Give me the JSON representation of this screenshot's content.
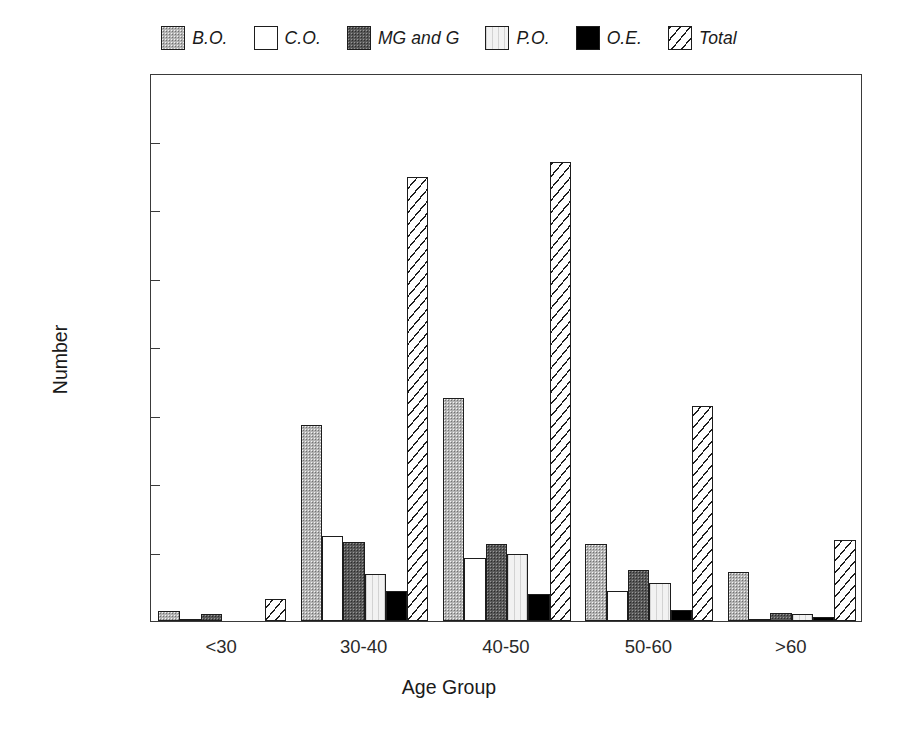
{
  "chart_data": {
    "type": "bar",
    "title": "",
    "subtitle": "",
    "xlabel": "Age Group",
    "ylabel": "Number",
    "categories": [
      "<30",
      "30-40",
      "40-50",
      "50-60",
      ">60"
    ],
    "ylim": [
      0,
      400
    ],
    "yticks": [
      0,
      50,
      100,
      150,
      200,
      250,
      300,
      350,
      400
    ],
    "grid": false,
    "legend_position": "top-center",
    "series": [
      {
        "name": "B.O.",
        "pattern": "gray-stipple",
        "values": [
          7,
          143,
          163,
          56,
          36
        ]
      },
      {
        "name": "C.O.",
        "pattern": "white-outline",
        "values": [
          1,
          62,
          46,
          22,
          1
        ]
      },
      {
        "name": "MG and G",
        "pattern": "dark-gray-stipple",
        "values": [
          5,
          58,
          56,
          37,
          6
        ]
      },
      {
        "name": "P.O.",
        "pattern": "light-vertical",
        "values": [
          0,
          34,
          49,
          28,
          5
        ]
      },
      {
        "name": "O.E.",
        "pattern": "solid-black",
        "values": [
          0,
          22,
          20,
          8,
          3
        ]
      },
      {
        "name": "Total",
        "pattern": "diagonal-hatch",
        "values": [
          16,
          324,
          335,
          157,
          59
        ]
      }
    ]
  },
  "legend": {
    "items": [
      {
        "label": "B.O."
      },
      {
        "label": "C.O."
      },
      {
        "label": "MG and G"
      },
      {
        "label": "P.O."
      },
      {
        "label": "O.E."
      },
      {
        "label": "Total"
      }
    ]
  },
  "axes": {
    "y_tick_labels": [
      "0",
      "50",
      "100",
      "150",
      "200",
      "250",
      "300",
      "350",
      "400"
    ],
    "x_tick_labels": [
      "<30",
      "30-40",
      "40-50",
      "50-60",
      ">60"
    ],
    "y_title": "Number",
    "x_title": "Age Group"
  },
  "colors": {
    "axis": "#3a3a3a",
    "text": "#1a1a1a",
    "bo_fill": "#b3b3b3",
    "co_fill": "#ffffff",
    "mgg_fill": "#585858",
    "po_fill": "#f2f2f2",
    "oe_fill": "#000000",
    "total_fill": "#ffffff"
  }
}
